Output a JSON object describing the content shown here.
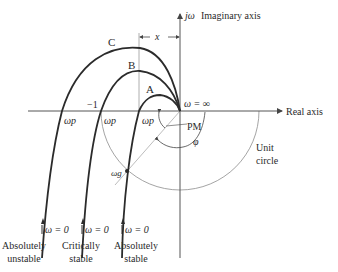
{
  "axes": {
    "imaginary_label": "Imaginary axis",
    "imaginary_symbol": "jω",
    "real_label": "Real axis",
    "minus_one": "−1",
    "x_dim": "x"
  },
  "curves": [
    {
      "id": "C",
      "label": "C",
      "crossing_label": "ωp",
      "start_label": "ω = 0",
      "caption_line1": "Absolutely",
      "caption_line2": "unstable"
    },
    {
      "id": "B",
      "label": "B",
      "crossing_label": "ωp",
      "start_label": "ω = 0",
      "caption_line1": "Critically",
      "caption_line2": "stable"
    },
    {
      "id": "A",
      "label": "A",
      "crossing_label": "ωp",
      "start_label": "ω = 0",
      "caption_line1": "Absolutely",
      "caption_line2": "stable"
    }
  ],
  "annotations": {
    "omega_inf": "ω = ∞",
    "pm": "PM",
    "phi": "φ",
    "omega_g": "ωg",
    "unit_circle_line1": "Unit",
    "unit_circle_line2": "circle"
  },
  "colors": {
    "curve": "#2b2b2b",
    "axis": "#555555",
    "circle": "#999999",
    "guide": "#bbbbbb"
  }
}
